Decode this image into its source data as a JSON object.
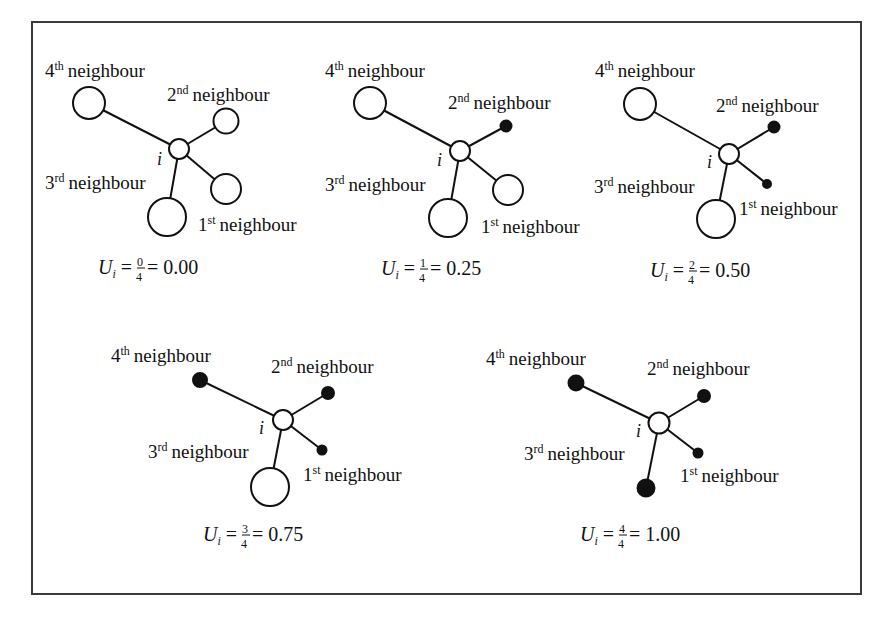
{
  "figure": {
    "panels": [
      {
        "id": "panel-1",
        "center_label": "i",
        "labels": {
          "n4": "4",
          "n4_sup": "th",
          "n2": "2",
          "n2_sup": "nd",
          "n3": "3",
          "n3_sup": "rd",
          "n1": "1",
          "n1_sup": "st",
          "word": "neighbour"
        },
        "formula": {
          "lhs": "U",
          "sub": "i",
          "eq": "=",
          "num": "0",
          "den": "4",
          "result": "= 0.00"
        },
        "uncertain_count": 0,
        "neighbour_states": {
          "first": "open",
          "second": "open",
          "third": "open",
          "fourth": "open"
        }
      },
      {
        "id": "panel-2",
        "center_label": "i",
        "labels": {
          "n4": "4",
          "n4_sup": "th",
          "n2": "2",
          "n2_sup": "nd",
          "n3": "3",
          "n3_sup": "rd",
          "n1": "1",
          "n1_sup": "st",
          "word": "neighbour"
        },
        "formula": {
          "lhs": "U",
          "sub": "i",
          "eq": "=",
          "num": "1",
          "den": "4",
          "result": "= 0.25"
        },
        "uncertain_count": 1,
        "neighbour_states": {
          "first": "open",
          "second": "filled",
          "third": "open",
          "fourth": "open"
        }
      },
      {
        "id": "panel-3",
        "center_label": "i",
        "labels": {
          "n4": "4",
          "n4_sup": "th",
          "n2": "2",
          "n2_sup": "nd",
          "n3": "3",
          "n3_sup": "rd",
          "n1": "1",
          "n1_sup": "st",
          "word": "neighbour"
        },
        "formula": {
          "lhs": "U",
          "sub": "i",
          "eq": "=",
          "num": "2",
          "den": "4",
          "result": "= 0.50"
        },
        "uncertain_count": 2,
        "neighbour_states": {
          "first": "filled",
          "second": "filled",
          "third": "open",
          "fourth": "open"
        }
      },
      {
        "id": "panel-4",
        "center_label": "i",
        "labels": {
          "n4": "4",
          "n4_sup": "th",
          "n2": "2",
          "n2_sup": "nd",
          "n3": "3",
          "n3_sup": "rd",
          "n1": "1",
          "n1_sup": "st",
          "word": "neighbour"
        },
        "formula": {
          "lhs": "U",
          "sub": "i",
          "eq": "=",
          "num": "3",
          "den": "4",
          "result": "= 0.75"
        },
        "uncertain_count": 3,
        "neighbour_states": {
          "first": "filled",
          "second": "filled",
          "third": "open",
          "fourth": "filled"
        }
      },
      {
        "id": "panel-5",
        "center_label": "i",
        "labels": {
          "n4": "4",
          "n4_sup": "th",
          "n2": "2",
          "n2_sup": "nd",
          "n3": "3",
          "n3_sup": "rd",
          "n1": "1",
          "n1_sup": "st",
          "word": "neighbour"
        },
        "formula": {
          "lhs": "U",
          "sub": "i",
          "eq": "=",
          "num": "4",
          "den": "4",
          "result": "= 1.00"
        },
        "uncertain_count": 4,
        "neighbour_states": {
          "first": "filled",
          "second": "filled",
          "third": "filled",
          "fourth": "filled"
        }
      }
    ],
    "colors": {
      "stroke": "#111111",
      "fill_open": "#ffffff",
      "fill_filled": "#111111",
      "frame": "#3a3a3a"
    }
  }
}
